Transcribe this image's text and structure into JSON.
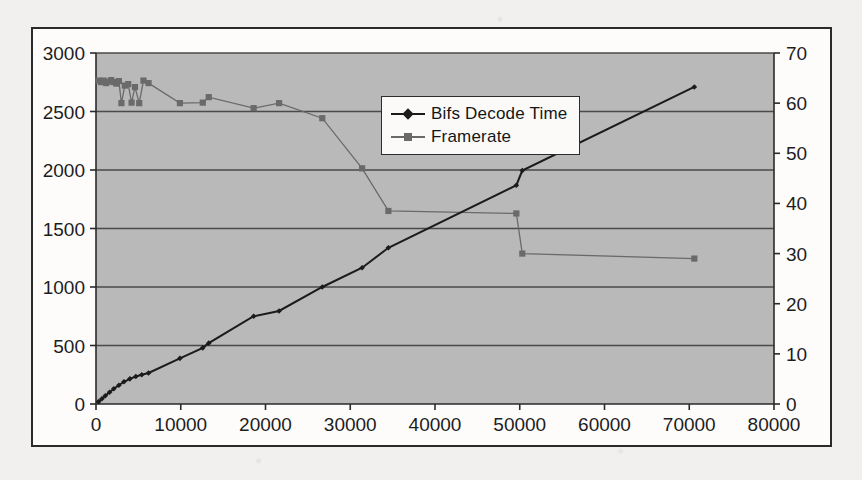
{
  "figure": {
    "background_color": "#fdfcfb",
    "plot_background_color": "#b9b9b9",
    "border_color": "#2a2a2a",
    "gridline_color": "#4a4a4a"
  },
  "legend": {
    "position": "top-center-right",
    "entries": [
      {
        "label": "Bifs Decode Time",
        "marker": "diamond",
        "color": "#1b1b1b"
      },
      {
        "label": "Framerate",
        "marker": "square",
        "color": "#6a6a6a"
      }
    ]
  },
  "chart_data": {
    "type": "line",
    "title": "",
    "subtitle": "",
    "xlabel": "",
    "ylabel": "",
    "y2label": "",
    "grid": true,
    "legend_position": "upper center",
    "xlim": [
      0,
      80000
    ],
    "ylim": [
      0,
      3000
    ],
    "y2lim": [
      0,
      70
    ],
    "xticks": [
      0,
      10000,
      20000,
      30000,
      40000,
      50000,
      60000,
      70000,
      80000
    ],
    "xtick_labels": [
      "0",
      "10000",
      "20000",
      "30000",
      "40000",
      "50000",
      "60000",
      "70000",
      "80000"
    ],
    "yticks": [
      0,
      500,
      1000,
      1500,
      2000,
      2500,
      3000
    ],
    "ytick_labels": [
      "0",
      "500",
      "1000",
      "1500",
      "2000",
      "2500",
      "3000"
    ],
    "y2ticks": [
      0,
      10,
      20,
      30,
      40,
      50,
      60,
      70
    ],
    "y2tick_labels": [
      "0",
      "10",
      "20",
      "30",
      "40",
      "50",
      "60",
      "70"
    ],
    "series": [
      {
        "name": "Bifs Decode Time",
        "axis": "left",
        "marker": "diamond",
        "color": "#1b1b1b",
        "x": [
          300,
          700,
          1100,
          1600,
          2100,
          2700,
          3300,
          4000,
          4700,
          5400,
          6200,
          9900,
          12600,
          13300,
          18600,
          21600,
          26700,
          31400,
          34500,
          49600,
          50300,
          70600
        ],
        "y": [
          20,
          45,
          70,
          100,
          130,
          160,
          190,
          215,
          235,
          250,
          265,
          390,
          480,
          520,
          750,
          795,
          1000,
          1165,
          1335,
          1870,
          1995,
          2710
        ]
      },
      {
        "name": "Framerate",
        "axis": "right",
        "marker": "square",
        "color": "#6a6a6a",
        "x": [
          300,
          600,
          900,
          1200,
          1500,
          1800,
          2100,
          2400,
          2700,
          3000,
          3400,
          3800,
          4200,
          4600,
          5100,
          5600,
          6200,
          9900,
          12600,
          13300,
          18600,
          21600,
          26700,
          31400,
          34500,
          49600,
          50300,
          70600
        ],
        "y": [
          64.5,
          64.2,
          64.5,
          64.0,
          64.3,
          64.6,
          64.2,
          63.9,
          64.4,
          60.0,
          63.5,
          63.8,
          60.1,
          63.2,
          60.0,
          64.5,
          64.0,
          60.0,
          60.1,
          61.2,
          59.0,
          60.0,
          57.0,
          47.0,
          38.5,
          38.0,
          30.0,
          29.0
        ]
      }
    ]
  },
  "caption": {
    "smudge_text": ""
  }
}
